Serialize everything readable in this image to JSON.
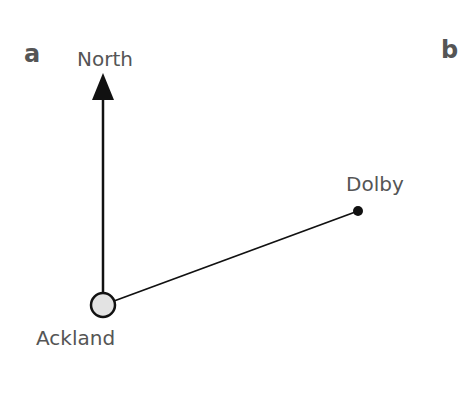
{
  "panels": [
    {
      "label": "a"
    },
    {
      "label": "b"
    }
  ],
  "diagram": {
    "north_label": "North",
    "points": [
      {
        "name": "Ackland",
        "x": 103,
        "y": 305,
        "marker": "open-circle",
        "fill": "#e3e3e3"
      },
      {
        "name": "Dolby",
        "x": 358,
        "y": 211,
        "marker": "filled-dot",
        "fill": "#111111"
      }
    ],
    "north_arrow": {
      "from": [
        103,
        293
      ],
      "to": [
        103,
        74
      ]
    },
    "line_color": "#111111",
    "text_color": "#555555"
  }
}
